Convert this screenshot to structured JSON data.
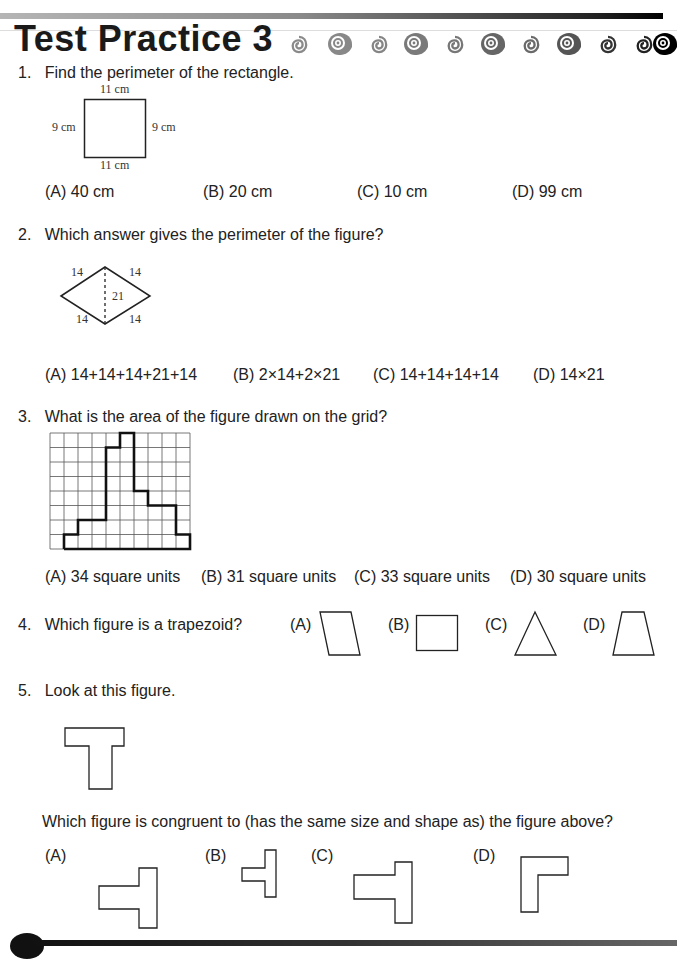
{
  "header": {
    "title": "Test Practice 3",
    "decoration": [
      "spiral-small",
      "spiral-large",
      "spiral-small",
      "spiral-large",
      "spiral-small",
      "spiral-large",
      "spiral-small",
      "spiral-large",
      "spiral-small",
      "spiral-small",
      "spiral-large"
    ]
  },
  "questions": [
    {
      "number": "1.",
      "text": "Find the perimeter of the rectangle.",
      "figure": {
        "top": "11 cm",
        "bottom": "11 cm",
        "left": "9 cm",
        "right": "9 cm"
      },
      "options": [
        "(A) 40 cm",
        "(B) 20 cm",
        "(C) 10 cm",
        "(D) 99 cm"
      ]
    },
    {
      "number": "2.",
      "text": "Which answer gives the perimeter of the figure?",
      "figure": {
        "top_left": "14",
        "top_right": "14",
        "bottom_left": "14",
        "bottom_right": "14",
        "diagonal": "21"
      },
      "options": [
        "(A) 14+14+14+21+14",
        "(B) 2×14+2×21",
        "(C) 14+14+14+14",
        "(D) 14×21"
      ]
    },
    {
      "number": "3.",
      "text": "What is the area of the figure drawn on the grid?",
      "figure": {
        "grid_cols": 10,
        "grid_rows": 8,
        "column_heights": [
          0,
          1,
          2,
          2,
          7,
          8,
          4,
          3,
          3,
          1
        ]
      },
      "options": [
        "(A) 34 square units",
        "(B) 31 square units",
        "(C) 33 square units",
        "(D) 30 square units"
      ]
    },
    {
      "number": "4.",
      "text": "Which figure is a trapezoid?",
      "options": [
        "(A)",
        "(B)",
        "(C)",
        "(D)"
      ],
      "option_shapes": [
        "parallelogram",
        "rectangle",
        "triangle",
        "trapezoid"
      ]
    },
    {
      "number": "5.",
      "text": "Look at this figure.",
      "subtext": "Which figure is congruent to (has the same size and shape as) the figure above?",
      "options": [
        "(A)",
        "(B)",
        "(C)",
        "(D)"
      ],
      "option_shapes": [
        "t-rotated-large",
        "t-rotated-small",
        "t-rotated",
        "l-shape"
      ]
    }
  ]
}
